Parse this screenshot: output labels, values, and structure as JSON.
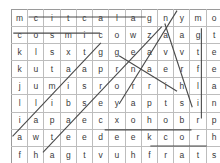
{
  "puzzle": {
    "kind": "word-search",
    "rows": 9,
    "cols": 13,
    "grid": [
      [
        "m",
        "c",
        "i",
        "t",
        "c",
        "a",
        "l",
        "a",
        "g",
        "n",
        "y",
        "m",
        "o"
      ],
      [
        "c",
        "o",
        "s",
        "m",
        "i",
        "c",
        "o",
        "w",
        "z",
        "a",
        "a",
        "g",
        "t"
      ],
      [
        "k",
        "l",
        "s",
        "x",
        "t",
        "g",
        "g",
        "e",
        "a",
        "v",
        "v",
        "t",
        "e"
      ],
      [
        "k",
        "u",
        "t",
        "a",
        "a",
        "p",
        "r",
        "n",
        "a",
        "e",
        "r",
        "f",
        "e"
      ],
      [
        "j",
        "u",
        "m",
        "i",
        "s",
        "r",
        "o",
        "r",
        "r",
        "i",
        "h",
        "l",
        "a"
      ],
      [
        "l",
        "l",
        "i",
        "b",
        "s",
        "e",
        "y",
        "a",
        "p",
        "t",
        "s",
        "i",
        "n"
      ],
      [
        "i",
        "a",
        "p",
        "a",
        "e",
        "c",
        "x",
        "o",
        "h",
        "o",
        "b",
        "r",
        "p"
      ],
      [
        "a",
        "w",
        "t",
        "e",
        "e",
        "d",
        "e",
        "e",
        "k",
        "c",
        "o",
        "r",
        "h"
      ],
      [
        "f",
        "h",
        "a",
        "g",
        "t",
        "v",
        "u",
        "h",
        "f",
        "r",
        "a",
        "t",
        "s"
      ]
    ],
    "found_words": [
      {
        "text": "galactic",
        "direction": "horizontal-reversed",
        "row": 1,
        "start_col": 2,
        "end_col": 9
      },
      {
        "text": "cosmic",
        "direction": "horizontal",
        "row": 2,
        "start_col": 1,
        "end_col": 6
      },
      {
        "text": "rocket",
        "direction": "horizontal-reversed",
        "row": 8,
        "start_col": 7,
        "end_col": 12
      },
      {
        "text": "stars",
        "direction": "horizontal-reversed",
        "row": 9,
        "start_col": 10,
        "end_col": 13
      },
      {
        "text": "telescope",
        "direction": "vertical",
        "col": 13,
        "start_row": 2,
        "end_row": 7
      },
      {
        "text": "diagonal-up-1",
        "direction": "diagonal-up",
        "start_row": 8,
        "start_col": 1,
        "end_row": 3,
        "end_col": 6
      },
      {
        "text": "diagonal-up-2",
        "direction": "diagonal-up",
        "start_row": 9,
        "start_col": 3,
        "end_row": 2,
        "end_col": 10
      },
      {
        "text": "diagonal-up-3",
        "direction": "diagonal-up",
        "start_row": 6,
        "start_col": 8,
        "end_row": 1,
        "end_col": 11
      },
      {
        "text": "diagonal-down-1",
        "direction": "diagonal-down",
        "start_row": 1,
        "start_col": 11,
        "end_row": 7,
        "end_col": 12
      },
      {
        "text": "diagonal-down-2",
        "direction": "diagonal-down",
        "start_row": 3,
        "start_col": 8,
        "end_row": 6,
        "end_col": 11
      }
    ],
    "colors": {
      "grid_line": "#bdbdbd",
      "grid_border": "#9a9a9a",
      "letter": "#3a3a3a",
      "strike": "#4a4a4a",
      "background": "#ffffff"
    }
  }
}
